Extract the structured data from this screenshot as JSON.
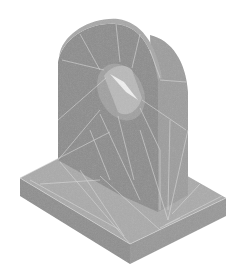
{
  "figure": {
    "colors": {
      "background": "#ffffff",
      "base_top": "#a9a9a9",
      "base_side_left": "#8e8e8e",
      "base_side_right": "#979797",
      "lug_front": "#8a8a8a",
      "lug_side": "#9a9a9a",
      "lug_top_edge": "#a6a6a6",
      "hole_inner": "#b8b8b8",
      "hole_light": "#f2f2f2",
      "mesh_lines": "#d6d6d6"
    }
  }
}
